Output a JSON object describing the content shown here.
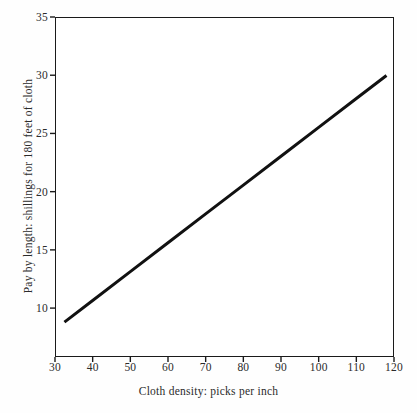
{
  "chart_data": {
    "type": "line",
    "title": "",
    "xlabel": "Cloth density: picks per inch",
    "ylabel": "Pay by length: shillings for 180 feet of cloth",
    "xlim": [
      30,
      120
    ],
    "ylim": [
      5.8,
      35
    ],
    "xticks": [
      30,
      40,
      50,
      60,
      70,
      80,
      90,
      100,
      110,
      120
    ],
    "yticks": [
      10,
      15,
      20,
      25,
      30,
      35
    ],
    "xtick_labels": [
      "30",
      "40",
      "50",
      "60",
      "70",
      "80",
      "90",
      "100",
      "110",
      "120"
    ],
    "ytick_labels": [
      "10",
      "15",
      "20",
      "25",
      "30",
      "35"
    ],
    "grid": false,
    "legend": null,
    "series": [
      {
        "name": "Pay by length",
        "color": "#111111",
        "line_width": 3,
        "x": [
          32.5,
          40,
          50,
          60,
          70,
          80,
          90,
          100,
          110,
          118
        ],
        "y": [
          8.8,
          10.65,
          13.13,
          15.61,
          18.09,
          20.56,
          23.04,
          25.52,
          28.0,
          29.98
        ]
      }
    ],
    "annotations": []
  },
  "axes": {
    "frame_color": "#1a1a1a",
    "background": "#ffffff"
  }
}
